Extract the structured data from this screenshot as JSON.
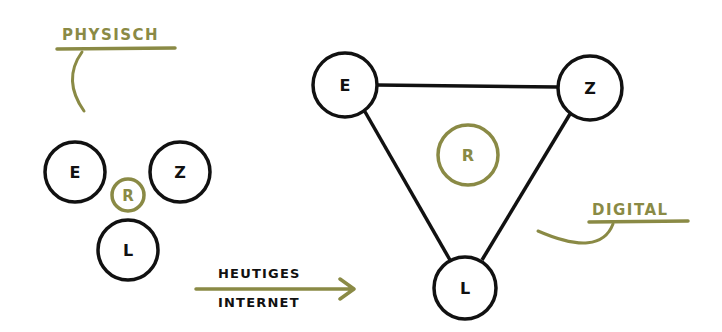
{
  "colors": {
    "ink": "#111111",
    "accent": "#8a8a45",
    "background": "#ffffff"
  },
  "physical": {
    "label": "PHYSISCH",
    "nodes": [
      {
        "id": "E",
        "label": "E",
        "cx": 75,
        "cy": 172,
        "r": 30
      },
      {
        "id": "Z",
        "label": "Z",
        "cx": 180,
        "cy": 172,
        "r": 30
      },
      {
        "id": "L",
        "label": "L",
        "cx": 128,
        "cy": 250,
        "r": 30
      },
      {
        "id": "R",
        "label": "R",
        "cx": 128,
        "cy": 195,
        "r": 17
      }
    ]
  },
  "transition": {
    "line1": "HEUTIGES",
    "line2": "INTERNET"
  },
  "digital": {
    "label": "DIGITAL",
    "nodes": [
      {
        "id": "E",
        "label": "E",
        "cx": 345,
        "cy": 85,
        "r": 32
      },
      {
        "id": "Z",
        "label": "Z",
        "cx": 590,
        "cy": 88,
        "r": 32
      },
      {
        "id": "L",
        "label": "L",
        "cx": 465,
        "cy": 288,
        "r": 31
      },
      {
        "id": "R",
        "label": "R",
        "cx": 468,
        "cy": 155,
        "r": 30
      }
    ],
    "edges": [
      [
        "E",
        "Z"
      ],
      [
        "E",
        "L"
      ],
      [
        "Z",
        "L"
      ]
    ]
  }
}
